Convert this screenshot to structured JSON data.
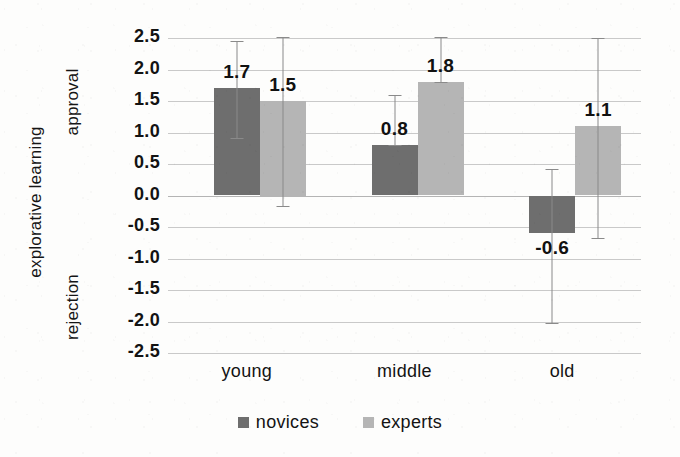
{
  "chart_data": {
    "type": "bar",
    "title": "",
    "subtitle": "",
    "xlabel": "",
    "ylabel": "explorative learning",
    "ylim": [
      -2.5,
      2.5
    ],
    "ytick_labels": [
      "2.5",
      "2.0",
      "1.5",
      "1.0",
      "0.5",
      "0.0",
      "-0.5",
      "-1.0",
      "-1.5",
      "-2.0",
      "-2.5"
    ],
    "ytick_values": [
      2.5,
      2.0,
      1.5,
      1.0,
      0.5,
      0.0,
      -0.5,
      -1.0,
      -1.5,
      -2.0,
      -2.5
    ],
    "grid": true,
    "legend_position": "bottom",
    "categories": [
      "young",
      "middle",
      "old"
    ],
    "series": [
      {
        "name": "novices",
        "color": "#6e6e6e",
        "values": [
          1.7,
          0.8,
          -0.6
        ],
        "data_labels": [
          "1.7",
          "0.8",
          "-0.6"
        ],
        "error_low": [
          0.92,
          0.8,
          -2.02
        ],
        "error_high": [
          2.45,
          1.6,
          0.42
        ]
      },
      {
        "name": "experts",
        "color": "#b5b5b5",
        "values": [
          1.5,
          1.8,
          1.1
        ],
        "data_labels": [
          "1.5",
          "1.8",
          "1.1"
        ],
        "error_low": [
          -0.17,
          1.8,
          -0.68
        ],
        "error_high": [
          2.52,
          2.52,
          2.5
        ]
      }
    ],
    "axis_annotations": [
      {
        "name": "approval",
        "label": "approval",
        "at_value": 1.7
      },
      {
        "name": "rejection",
        "label": "rejection",
        "at_value": -1.55
      }
    ]
  },
  "legend": {
    "items": [
      {
        "label": "novices",
        "color": "#6e6e6e"
      },
      {
        "label": "experts",
        "color": "#b5b5b5"
      }
    ]
  }
}
